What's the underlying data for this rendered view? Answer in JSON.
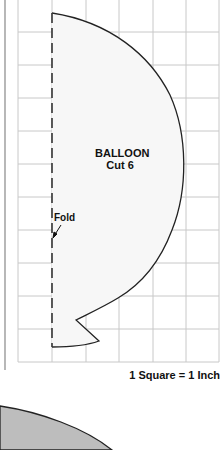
{
  "pattern": {
    "title": "BALLOON",
    "instruction": "Cut 6",
    "fold_label": "Fold",
    "scale_note": "1 Square = 1 Inch"
  },
  "colors": {
    "grid_line": "#c8c8c8",
    "outline": "#222222",
    "pattern_fill": "#f7f7f7",
    "shape_fill": "#bdbdbd",
    "border_line": "#888888"
  },
  "grid": {
    "columns": 6,
    "rows": 11,
    "square_px": 33.5,
    "unit": "1 inch"
  }
}
